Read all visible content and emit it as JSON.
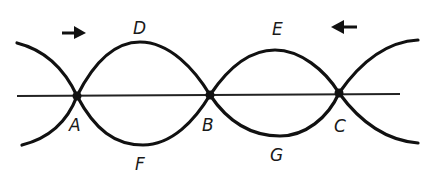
{
  "diagram": {
    "type": "standing-wave",
    "colors": {
      "stroke": "#111111",
      "background": "#ffffff"
    },
    "nodes": [
      {
        "id": "A",
        "label": "A"
      },
      {
        "id": "B",
        "label": "B"
      },
      {
        "id": "C",
        "label": "C"
      }
    ],
    "antinodes_top": [
      {
        "id": "D",
        "label": "D"
      },
      {
        "id": "E",
        "label": "E"
      }
    ],
    "antinodes_bottom": [
      {
        "id": "F",
        "label": "F"
      },
      {
        "id": "G",
        "label": "G"
      }
    ],
    "arrows": [
      {
        "id": "arrow-left-wave",
        "direction": "right"
      },
      {
        "id": "arrow-right-wave",
        "direction": "left"
      }
    ]
  }
}
